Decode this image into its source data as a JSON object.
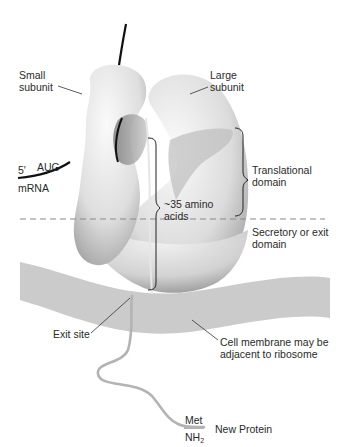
{
  "diagram": {
    "labels": {
      "small_subunit": [
        "Small",
        "subunit"
      ],
      "large_subunit": [
        "Large",
        "subunit"
      ],
      "five_prime": "5′",
      "aug": "AUG",
      "mrna": "mRNA",
      "amino_acids": [
        "~35 amino",
        "acids"
      ],
      "translational_domain": [
        "Translational",
        "domain"
      ],
      "secretory_domain": [
        "Secretory or exit",
        "domain"
      ],
      "exit_site": "Exit site",
      "cell_membrane": [
        "Cell membrane may be",
        "adjacent to ribosome"
      ],
      "met": "Met",
      "nh2_base": "NH",
      "nh2_sub": "2",
      "new_protein": "New Protein"
    },
    "colors": {
      "membrane": "#c9c9c9",
      "ribosome_light": "#f4f4f4",
      "ribosome_shadow": "#9a9a9a",
      "mrna": "#111111",
      "protein": "#b5b5b5",
      "dashed_line": "#8a8a8a",
      "text": "#2a2a2a"
    }
  }
}
